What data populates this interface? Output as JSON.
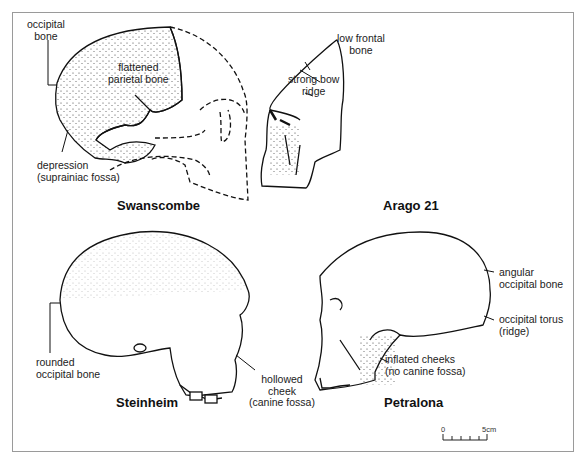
{
  "figure": {
    "panels": [
      {
        "title": "Swanscombe",
        "labels": [
          {
            "text": "occipital\nbone"
          },
          {
            "text": "flattened\nparietal bone"
          },
          {
            "text": "depression\n(suprainiac fossa)"
          }
        ]
      },
      {
        "title": "Arago 21",
        "labels": [
          {
            "text": "low frontal\nbone"
          },
          {
            "text": "strong bow\nridge"
          }
        ]
      },
      {
        "title": "Steinheim",
        "labels": [
          {
            "text": "rounded\noccipital bone"
          },
          {
            "text": "hollowed\ncheek\n(canine fossa)"
          }
        ]
      },
      {
        "title": "Petralona",
        "labels": [
          {
            "text": "angular\noccipital bone"
          },
          {
            "text": "occipital torus\n(ridge)"
          },
          {
            "text": "inflated cheeks\n(no canine fossa)"
          }
        ]
      }
    ],
    "scale_bar": {
      "start": "0",
      "end": "5cm",
      "ticks": 6
    },
    "colors": {
      "frame": "#9a9a9a",
      "ink": "#111111"
    }
  }
}
